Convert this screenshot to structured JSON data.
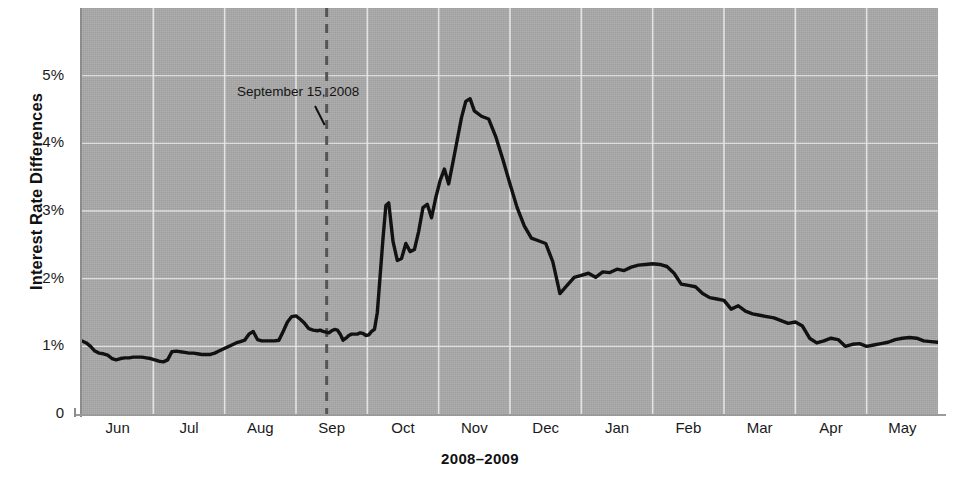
{
  "chart_data": {
    "type": "line",
    "title": "",
    "xlabel": "2008–2009",
    "ylabel": "Interest Rate Differences",
    "xlim": [
      0,
      12
    ],
    "ylim": [
      0,
      6
    ],
    "grid": true,
    "legend": null,
    "line_color": "#111111",
    "plot_background": "#a9a9a9",
    "gridline_color": "#e8e8e8",
    "x_tick_labels": [
      "Jun",
      "Jul",
      "Aug",
      "Sep",
      "Oct",
      "Nov",
      "Dec",
      "Jan",
      "Feb",
      "Mar",
      "Apr",
      "May"
    ],
    "y_tick_labels": [
      "0",
      "1%",
      "2%",
      "3%",
      "4%",
      "5%"
    ],
    "y_tick_values": [
      0,
      1,
      2,
      3,
      4,
      5
    ],
    "annotations": [
      {
        "label": "September 15, 2008",
        "x_value": 3.43,
        "marker": "dashed-vertical-line",
        "marker_color": "#555555"
      }
    ],
    "series": [
      {
        "name": "Interest Rate Difference",
        "x": [
          0.0,
          0.06,
          0.12,
          0.18,
          0.24,
          0.3,
          0.36,
          0.42,
          0.48,
          0.54,
          0.6,
          0.66,
          0.72,
          0.78,
          0.84,
          0.9,
          0.96,
          1.02,
          1.08,
          1.14,
          1.2,
          1.26,
          1.32,
          1.38,
          1.44,
          1.5,
          1.56,
          1.62,
          1.68,
          1.74,
          1.8,
          1.86,
          1.92,
          1.98,
          2.04,
          2.1,
          2.16,
          2.22,
          2.28,
          2.34,
          2.4,
          2.46,
          2.52,
          2.58,
          2.64,
          2.7,
          2.76,
          2.82,
          2.88,
          2.94,
          3.0,
          3.06,
          3.12,
          3.18,
          3.24,
          3.3,
          3.34,
          3.38,
          3.42,
          3.46,
          3.5,
          3.54,
          3.58,
          3.62,
          3.66,
          3.7,
          3.74,
          3.78,
          3.82,
          3.86,
          3.9,
          3.94,
          3.98,
          4.02,
          4.06,
          4.1,
          4.14,
          4.18,
          4.22,
          4.26,
          4.3,
          4.36,
          4.42,
          4.48,
          4.54,
          4.6,
          4.66,
          4.72,
          4.78,
          4.84,
          4.9,
          4.96,
          5.02,
          5.08,
          5.14,
          5.2,
          5.26,
          5.32,
          5.38,
          5.44,
          5.5,
          5.6,
          5.7,
          5.8,
          5.9,
          6.0,
          6.1,
          6.2,
          6.3,
          6.4,
          6.5,
          6.6,
          6.7,
          6.8,
          6.9,
          7.0,
          7.1,
          7.2,
          7.3,
          7.4,
          7.5,
          7.6,
          7.7,
          7.8,
          7.9,
          8.0,
          8.1,
          8.2,
          8.3,
          8.4,
          8.5,
          8.6,
          8.7,
          8.8,
          8.9,
          9.0,
          9.1,
          9.2,
          9.3,
          9.4,
          9.5,
          9.6,
          9.7,
          9.8,
          9.9,
          10.0,
          10.1,
          10.2,
          10.3,
          10.4,
          10.5,
          10.6,
          10.7,
          10.8,
          10.9,
          11.0,
          11.1,
          11.2,
          11.3,
          11.4,
          11.5,
          11.6,
          11.7,
          11.8,
          11.9,
          12.0
        ],
        "y": [
          1.08,
          1.05,
          1.0,
          0.93,
          0.9,
          0.89,
          0.87,
          0.82,
          0.8,
          0.82,
          0.83,
          0.83,
          0.84,
          0.84,
          0.84,
          0.83,
          0.82,
          0.8,
          0.78,
          0.77,
          0.8,
          0.92,
          0.93,
          0.92,
          0.91,
          0.9,
          0.9,
          0.89,
          0.88,
          0.88,
          0.88,
          0.9,
          0.93,
          0.96,
          0.99,
          1.02,
          1.05,
          1.07,
          1.09,
          1.18,
          1.22,
          1.1,
          1.08,
          1.08,
          1.08,
          1.08,
          1.09,
          1.22,
          1.36,
          1.44,
          1.45,
          1.4,
          1.34,
          1.26,
          1.24,
          1.23,
          1.24,
          1.22,
          1.21,
          1.2,
          1.23,
          1.25,
          1.24,
          1.18,
          1.09,
          1.12,
          1.16,
          1.18,
          1.18,
          1.18,
          1.2,
          1.19,
          1.16,
          1.17,
          1.22,
          1.25,
          1.5,
          2.05,
          2.6,
          3.08,
          3.12,
          2.55,
          2.27,
          2.3,
          2.52,
          2.4,
          2.43,
          2.7,
          3.05,
          3.1,
          2.9,
          3.2,
          3.45,
          3.62,
          3.4,
          3.72,
          4.05,
          4.38,
          4.62,
          4.66,
          4.48,
          4.4,
          4.36,
          4.1,
          3.76,
          3.4,
          3.05,
          2.78,
          2.6,
          2.56,
          2.52,
          2.25,
          1.78,
          1.9,
          2.02,
          2.05,
          2.08,
          2.02,
          2.1,
          2.09,
          2.14,
          2.12,
          2.17,
          2.2,
          2.21,
          2.22,
          2.21,
          2.18,
          2.08,
          1.92,
          1.9,
          1.88,
          1.78,
          1.72,
          1.7,
          1.68,
          1.55,
          1.6,
          1.52,
          1.48,
          1.46,
          1.44,
          1.42,
          1.38,
          1.34,
          1.36,
          1.3,
          1.12,
          1.05,
          1.08,
          1.12,
          1.1,
          1.0,
          1.03,
          1.04,
          1.0,
          1.02,
          1.04,
          1.06,
          1.1,
          1.12,
          1.13,
          1.12,
          1.08,
          1.07,
          1.06
        ]
      }
    ]
  },
  "annotation": {
    "text": "September 15, 2008"
  },
  "axes": {
    "y_title": "Interest Rate Differences",
    "x_title": "2008–2009"
  }
}
